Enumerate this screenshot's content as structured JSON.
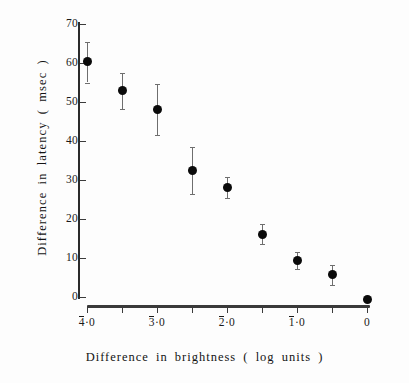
{
  "chart_data": {
    "type": "scatter",
    "title": "",
    "xlabel": "Difference  in   brightness  ( log  units )",
    "ylabel": "Difference  in  latency  ( msec )",
    "xlim": [
      -4.25,
      0.25
    ],
    "ylim": [
      0,
      70
    ],
    "grid": false,
    "legend": null,
    "x_tick_values": [
      -4.0,
      -3.5,
      -3.0,
      -2.5,
      -2.0,
      -1.5,
      -1.0,
      -0.5,
      0.0
    ],
    "x_tick_labels": [
      "4̖0",
      "",
      "3̖0",
      "",
      "2̖0",
      "",
      "1̖0",
      "",
      "0"
    ],
    "x_tick_labels_plain": [
      "-4·0",
      "",
      "-3·0",
      "",
      "-2·0",
      "",
      "-1·0",
      "",
      "0"
    ],
    "y_tick_values": [
      0,
      10,
      20,
      30,
      40,
      50,
      60,
      70
    ],
    "y_tick_labels": [
      "0",
      "10",
      "20",
      "30",
      "40",
      "50",
      "60",
      "70"
    ],
    "marker": "filled-circle",
    "marker_color": "#0a0a0a",
    "errorbar_color": "#6e6e6e",
    "points": [
      {
        "x": -4.0,
        "y": 60.5,
        "err_low": 55.0,
        "err_high": 65.5
      },
      {
        "x": -3.5,
        "y": 53.0,
        "err_low": 48.2,
        "err_high": 57.5
      },
      {
        "x": -3.0,
        "y": 48.0,
        "err_low": 41.5,
        "err_high": 54.5
      },
      {
        "x": -2.5,
        "y": 32.4,
        "err_low": 26.3,
        "err_high": 38.5
      },
      {
        "x": -2.0,
        "y": 28.1,
        "err_low": 25.5,
        "err_high": 30.8
      },
      {
        "x": -1.5,
        "y": 16.1,
        "err_low": 13.5,
        "err_high": 18.8
      },
      {
        "x": -1.0,
        "y": 9.3,
        "err_low": 7.3,
        "err_high": 11.5
      },
      {
        "x": -0.5,
        "y": 5.8,
        "err_low": 3.0,
        "err_high": 8.2
      },
      {
        "x": 0.0,
        "y": -0.6,
        "err_low": -0.6,
        "err_high": -0.6
      }
    ]
  }
}
